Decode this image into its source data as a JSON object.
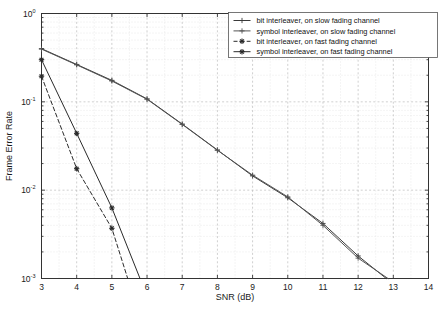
{
  "chart_data": {
    "type": "line",
    "title": "",
    "xlabel": "SNR (dB)",
    "ylabel": "Frame Error Rate",
    "xlim": [
      3,
      14
    ],
    "ylim": [
      0.001,
      1
    ],
    "yscale": "log",
    "xscale": "linear",
    "grid": true,
    "grid_minor": true,
    "legend_position": "upper right",
    "xticks": [
      "3",
      "4",
      "5",
      "6",
      "7",
      "8",
      "9",
      "10",
      "11",
      "12",
      "13",
      "14"
    ],
    "xtick_values": [
      3,
      4,
      5,
      6,
      7,
      8,
      9,
      10,
      11,
      12,
      13,
      14
    ],
    "yticks": [
      "10^0",
      "10^-1",
      "10^-2",
      "10^-3"
    ],
    "ytick_values": [
      1,
      0.1,
      0.01,
      0.001
    ],
    "ytick_mantissa": "10",
    "ytick_exponents": [
      "0",
      "-1",
      "-2",
      "-3"
    ],
    "series": [
      {
        "name": "bit interleaver, on slow fading channel",
        "marker": "plus",
        "linestyle": "solid",
        "color": "#3a3a3a",
        "x": [
          3,
          4,
          5,
          6,
          7,
          8,
          9,
          10,
          11,
          12,
          12.8
        ],
        "y": [
          0.4,
          0.265,
          0.175,
          0.108,
          0.056,
          0.0285,
          0.0145,
          0.0082,
          0.0042,
          0.0018,
          0.001
        ]
      },
      {
        "name": "symbol interleaver, on slow fading channel",
        "marker": "plus",
        "linestyle": "solid",
        "color": "#555555",
        "x": [
          3,
          4,
          5,
          6,
          7,
          8,
          9,
          10,
          11,
          12,
          12.85
        ],
        "y": [
          0.395,
          0.262,
          0.172,
          0.107,
          0.0555,
          0.0283,
          0.0148,
          0.0084,
          0.004,
          0.0017,
          0.001
        ]
      },
      {
        "name": "bit interleaver, on fast fading channel",
        "marker": "star",
        "linestyle": "dashed",
        "color": "#2a2a2a",
        "x": [
          3,
          4,
          5,
          5.45
        ],
        "y": [
          0.195,
          0.0175,
          0.0037,
          0.001
        ]
      },
      {
        "name": "symbol interleaver, on fast fading channel",
        "marker": "star",
        "linestyle": "solid",
        "color": "#2a2a2a",
        "x": [
          3,
          4,
          5,
          5.8
        ],
        "y": [
          0.3,
          0.044,
          0.0063,
          0.001
        ]
      }
    ]
  },
  "legend": {
    "entries": [
      {
        "label": "bit interleaver, on slow fading channel"
      },
      {
        "label": "symbol interleaver, on slow fading channel"
      },
      {
        "label": "bit interleaver, on fast fading channel"
      },
      {
        "label": "symbol interleaver, on fast fading channel"
      }
    ]
  },
  "colors": {
    "background": "#ffffff",
    "axis": "#333333",
    "grid_major": "#bbbbbb",
    "grid_minor": "#d8d8d8",
    "text": "#1a1a1a",
    "legend_border": "#555555"
  }
}
